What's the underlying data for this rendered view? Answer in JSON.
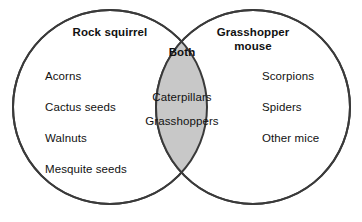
{
  "diagram": {
    "type": "venn",
    "background_color": "#ffffff",
    "stroke_color": "#3a3a3a",
    "overlap_fill_color": "#c8c8c8",
    "text_color": "#111111",
    "left_set": {
      "title": "Rock squirrel",
      "items": [
        "Acorns",
        "Cactus seeds",
        "Walnuts",
        "Mesquite seeds"
      ]
    },
    "right_set": {
      "title_line1": "Grasshopper",
      "title_line2": "mouse",
      "items": [
        "Scorpions",
        "Spiders",
        "Other mice"
      ]
    },
    "intersection": {
      "title": "Both",
      "items": [
        "Caterpillars",
        "Grasshoppers"
      ]
    }
  }
}
